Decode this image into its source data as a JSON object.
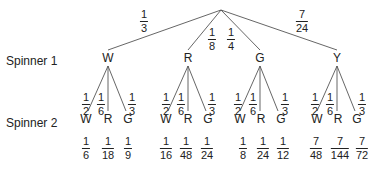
{
  "row_labels": {
    "spinner1": "Spinner 1",
    "spinner2": "Spinner 2"
  },
  "level1": [
    {
      "label": "W",
      "prob": {
        "num": "1",
        "den": "3"
      }
    },
    {
      "label": "R",
      "prob": {
        "num": "1",
        "den": "8"
      }
    },
    {
      "label": "G",
      "prob": {
        "num": "1",
        "den": "4"
      }
    },
    {
      "label": "Y",
      "prob": {
        "num": "7",
        "den": "24"
      }
    }
  ],
  "level2_branches": [
    {
      "label": "W",
      "prob": {
        "num": "1",
        "den": "2"
      }
    },
    {
      "label": "R",
      "prob": {
        "num": "1",
        "den": "6"
      }
    },
    {
      "label": "G",
      "prob": {
        "num": "1",
        "den": "3"
      }
    }
  ],
  "outcomes": [
    [
      {
        "num": "1",
        "den": "6"
      },
      {
        "num": "1",
        "den": "18"
      },
      {
        "num": "1",
        "den": "9"
      }
    ],
    [
      {
        "num": "1",
        "den": "16"
      },
      {
        "num": "1",
        "den": "48"
      },
      {
        "num": "1",
        "den": "24"
      }
    ],
    [
      {
        "num": "1",
        "den": "8"
      },
      {
        "num": "1",
        "den": "24"
      },
      {
        "num": "1",
        "den": "12"
      }
    ],
    [
      {
        "num": "7",
        "den": "48"
      },
      {
        "num": "7",
        "den": "144"
      },
      {
        "num": "7",
        "den": "72"
      }
    ]
  ],
  "colors": {
    "line": "#555555",
    "text": "#222222"
  }
}
